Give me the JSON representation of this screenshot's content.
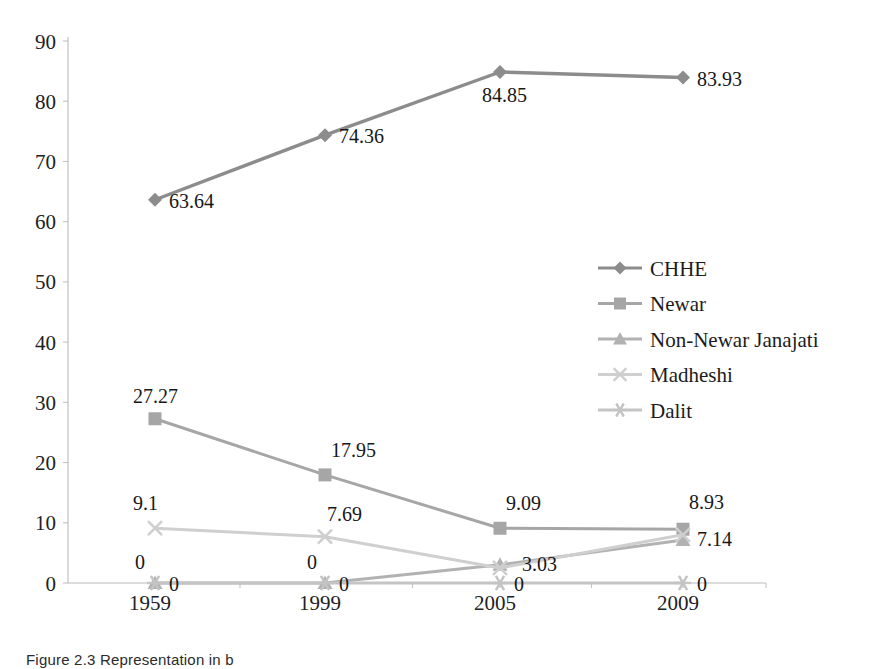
{
  "figure": {
    "caption": "Figure 2.3 Representation in b"
  },
  "chart_data": {
    "type": "line",
    "title": "",
    "xlabel": "",
    "ylabel": "",
    "categories": [
      "1959",
      "1999",
      "2005",
      "2009"
    ],
    "ylim": [
      0,
      90
    ],
    "yticks": [
      0,
      10,
      20,
      30,
      40,
      50,
      60,
      70,
      80,
      90
    ],
    "grid": false,
    "legend_position": "right",
    "series": [
      {
        "name": "CHHE",
        "marker": "diamond",
        "color": "#8c8c8c",
        "values": [
          63.64,
          74.36,
          84.85,
          83.93
        ],
        "labels": [
          "63.64",
          "74.36",
          "84.85",
          "83.93"
        ]
      },
      {
        "name": "Newar",
        "marker": "square",
        "color": "#a6a6a6",
        "values": [
          27.27,
          17.95,
          9.09,
          8.93
        ],
        "labels": [
          "27.27",
          "17.95",
          "9.09",
          "8.93"
        ]
      },
      {
        "name": "Non-Newar Janajati",
        "marker": "triangle",
        "color": "#b2b2b2",
        "values": [
          0,
          0,
          3.03,
          7.14
        ],
        "labels": [
          "0",
          "0",
          "3.03",
          "7.14"
        ]
      },
      {
        "name": "Madheshi",
        "marker": "cross",
        "color": "#cfcfcf",
        "values": [
          9.1,
          7.69,
          2.5,
          8.0
        ],
        "labels": [
          "9.1",
          "7.69",
          "",
          ""
        ]
      },
      {
        "name": "Dalit",
        "marker": "star",
        "color": "#c4c4c4",
        "values": [
          0,
          0,
          0,
          0
        ],
        "labels": [
          "0",
          "0",
          "0",
          "0"
        ]
      }
    ]
  }
}
